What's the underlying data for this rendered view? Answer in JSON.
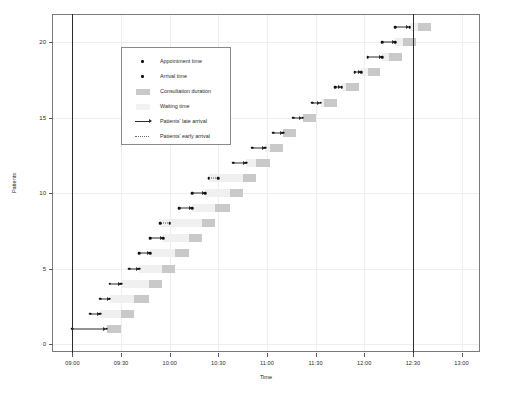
{
  "chart_data": {
    "type": "bar",
    "title": "",
    "xlabel": "Time",
    "ylabel": "Patients",
    "grid": true,
    "legend_position": "upper-left-inside",
    "x_tick_labels": [
      "09:00",
      "09:30",
      "10:00",
      "10:30",
      "11:00",
      "11:30",
      "12:00",
      "12:30",
      "13:00"
    ],
    "x_tick_values": [
      540,
      570,
      600,
      630,
      660,
      690,
      720,
      750,
      780
    ],
    "xlim_minutes": [
      528,
      792
    ],
    "y_tick_labels": [
      "0",
      "5",
      "10",
      "15",
      "20"
    ],
    "y_tick_values": [
      0,
      5,
      10,
      15,
      20
    ],
    "ylim": [
      -0.6,
      21.8
    ],
    "session_lines_minutes": [
      540,
      750
    ],
    "legend": [
      {
        "key": "dot",
        "label": "Appointment time"
      },
      {
        "key": "dot",
        "label": "Arrival time"
      },
      {
        "key": "swatch-dark",
        "label": "Consultation duration"
      },
      {
        "key": "swatch-light",
        "label": "Waiting time"
      },
      {
        "key": "arrow-solid",
        "label": "Patients' late arrival"
      },
      {
        "key": "line-dotted",
        "label": "Patients' early arrival"
      }
    ],
    "series_names": [
      "Appointment time",
      "Arrival time",
      "Consultation duration",
      "Waiting time",
      "Patients' late arrival",
      "Patients' early arrival"
    ],
    "patients": [
      {
        "patient": 1,
        "appointment": 540,
        "arrival": 561,
        "arrival_type": "late",
        "wait_start": 561,
        "wait_end": 561,
        "consult_start": 561,
        "consult_end": 570
      },
      {
        "patient": 2,
        "appointment": 551,
        "arrival": 557,
        "arrival_type": "late",
        "wait_start": 557,
        "wait_end": 570,
        "consult_start": 570,
        "consult_end": 578
      },
      {
        "patient": 3,
        "appointment": 557,
        "arrival": 563,
        "arrival_type": "late",
        "wait_start": 563,
        "wait_end": 578,
        "consult_start": 578,
        "consult_end": 587
      },
      {
        "patient": 4,
        "appointment": 563,
        "arrival": 570,
        "arrival_type": "late",
        "wait_start": 570,
        "wait_end": 587,
        "consult_start": 587,
        "consult_end": 595
      },
      {
        "patient": 5,
        "appointment": 575,
        "arrival": 581,
        "arrival_type": "late",
        "wait_start": 581,
        "wait_end": 595,
        "consult_start": 595,
        "consult_end": 603
      },
      {
        "patient": 6,
        "appointment": 581,
        "arrival": 588,
        "arrival_type": "late",
        "wait_start": 588,
        "wait_end": 603,
        "consult_start": 603,
        "consult_end": 612
      },
      {
        "patient": 7,
        "appointment": 588,
        "arrival": 596,
        "arrival_type": "late",
        "wait_start": 596,
        "wait_end": 612,
        "consult_start": 612,
        "consult_end": 620
      },
      {
        "patient": 8,
        "appointment": 600,
        "arrival": 594,
        "arrival_type": "early",
        "wait_start": 594,
        "wait_end": 620,
        "consult_start": 620,
        "consult_end": 628
      },
      {
        "patient": 9,
        "appointment": 606,
        "arrival": 614,
        "arrival_type": "late",
        "wait_start": 614,
        "wait_end": 628,
        "consult_start": 628,
        "consult_end": 637
      },
      {
        "patient": 10,
        "appointment": 614,
        "arrival": 622,
        "arrival_type": "late",
        "wait_start": 622,
        "wait_end": 637,
        "consult_start": 637,
        "consult_end": 645
      },
      {
        "patient": 11,
        "appointment": 630,
        "arrival": 624,
        "arrival_type": "early",
        "wait_start": 624,
        "wait_end": 645,
        "consult_start": 645,
        "consult_end": 653
      },
      {
        "patient": 12,
        "appointment": 639,
        "arrival": 647,
        "arrival_type": "late",
        "wait_start": 647,
        "wait_end": 653,
        "consult_start": 653,
        "consult_end": 662
      },
      {
        "patient": 13,
        "appointment": 651,
        "arrival": 659,
        "arrival_type": "late",
        "wait_start": 659,
        "wait_end": 662,
        "consult_start": 662,
        "consult_end": 670
      },
      {
        "patient": 14,
        "appointment": 664,
        "arrival": 670,
        "arrival_type": "late",
        "wait_start": 670,
        "wait_end": 670,
        "consult_start": 670,
        "consult_end": 678
      },
      {
        "patient": 15,
        "appointment": 676,
        "arrival": 682,
        "arrival_type": "late",
        "wait_start": 682,
        "wait_end": 682,
        "consult_start": 682,
        "consult_end": 690
      },
      {
        "patient": 16,
        "appointment": 688,
        "arrival": 693,
        "arrival_type": "late",
        "wait_start": 693,
        "wait_end": 695,
        "consult_start": 695,
        "consult_end": 703
      },
      {
        "patient": 17,
        "appointment": 702,
        "arrival": 706,
        "arrival_type": "late",
        "wait_start": 706,
        "wait_end": 709,
        "consult_start": 709,
        "consult_end": 717
      },
      {
        "patient": 18,
        "appointment": 714,
        "arrival": 718,
        "arrival_type": "late",
        "wait_start": 718,
        "wait_end": 722,
        "consult_start": 722,
        "consult_end": 730
      },
      {
        "patient": 19,
        "appointment": 722,
        "arrival": 731,
        "arrival_type": "late",
        "wait_start": 731,
        "wait_end": 735,
        "consult_start": 735,
        "consult_end": 743
      },
      {
        "patient": 20,
        "appointment": 731,
        "arrival": 739,
        "arrival_type": "late",
        "wait_start": 739,
        "wait_end": 744,
        "consult_start": 744,
        "consult_end": 752
      },
      {
        "patient": 21,
        "appointment": 739,
        "arrival": 748,
        "arrival_type": "late",
        "wait_start": 748,
        "wait_end": 753,
        "consult_start": 753,
        "consult_end": 761
      }
    ]
  }
}
